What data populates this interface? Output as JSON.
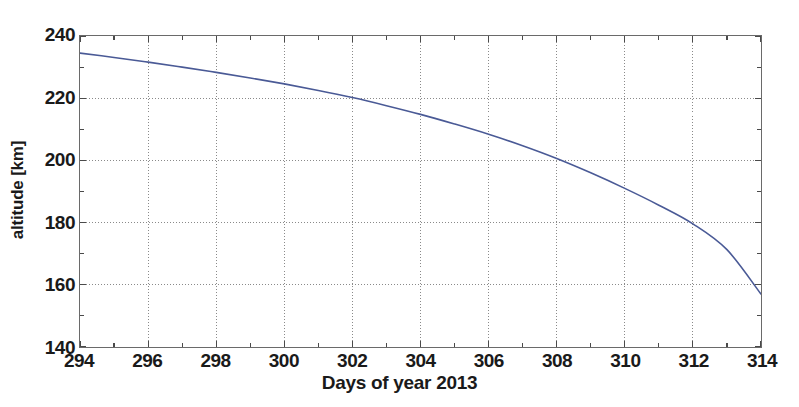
{
  "chart_data": {
    "type": "line",
    "title": "",
    "xlabel": "Days of year 2013",
    "ylabel": "altitude [km]",
    "xlim": [
      294,
      314
    ],
    "ylim": [
      140,
      240
    ],
    "xticks": [
      294,
      296,
      298,
      300,
      302,
      304,
      306,
      308,
      310,
      312,
      314
    ],
    "yticks": [
      140,
      160,
      180,
      200,
      220,
      240
    ],
    "xtick_labels": [
      "294",
      "296",
      "298",
      "300",
      "302",
      "304",
      "306",
      "308",
      "310",
      "312",
      "314"
    ],
    "ytick_labels": [
      "140",
      "160",
      "180",
      "200",
      "220",
      "240"
    ],
    "minor_ytick_step": 10,
    "minor_xtick_step": 1,
    "grid": true,
    "grid_style": "dotted",
    "grid_color": "#8a8a8a",
    "legend": null,
    "legend_position": "none",
    "series": [
      {
        "name": "altitude",
        "color": "#4a5a96",
        "line_width": 1.6,
        "x": [
          294,
          295,
          296,
          297,
          298,
          299,
          300,
          301,
          302,
          303,
          304,
          305,
          306,
          307,
          308,
          309,
          310,
          311,
          312,
          313,
          314
        ],
        "values": [
          234.5,
          233.1,
          231.6,
          230.0,
          228.3,
          226.5,
          224.6,
          222.5,
          220.2,
          217.6,
          214.8,
          211.7,
          208.4,
          204.7,
          200.6,
          196.0,
          191.0,
          185.6,
          179.6,
          171.3,
          157.0
        ]
      }
    ]
  },
  "axes": {
    "frame_color": "#6a6a6a",
    "background": "#ffffff"
  }
}
